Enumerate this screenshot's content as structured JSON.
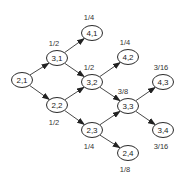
{
  "diagram": {
    "type": "directed-graph",
    "colors": {
      "stroke": "#2a2a2a",
      "text": "#222222",
      "background": "#ffffff"
    },
    "nodes": [
      {
        "id": "2,1",
        "label": "2,1",
        "x": 22,
        "y": 80,
        "prob": null,
        "prob_x": null,
        "prob_y": null
      },
      {
        "id": "3,1",
        "label": "3,1",
        "x": 57,
        "y": 58,
        "prob": "1/2",
        "prob_x": 54,
        "prob_y": 43
      },
      {
        "id": "4,1",
        "label": "4,1",
        "x": 92,
        "y": 33,
        "prob": "1/4",
        "prob_x": 89,
        "prob_y": 17
      },
      {
        "id": "3,2",
        "label": "3,2",
        "x": 92,
        "y": 82,
        "prob": "1/2",
        "prob_x": 89,
        "prob_y": 67
      },
      {
        "id": "4,2",
        "label": "4,2",
        "x": 128,
        "y": 57,
        "prob": "1/4",
        "prob_x": 125,
        "prob_y": 42
      },
      {
        "id": "2,2",
        "label": "2,2",
        "x": 57,
        "y": 105,
        "prob": "1/2",
        "prob_x": 54,
        "prob_y": 122
      },
      {
        "id": "3,3",
        "label": "3,3",
        "x": 128,
        "y": 106,
        "prob": "3/8",
        "prob_x": 123,
        "prob_y": 91
      },
      {
        "id": "4,3",
        "label": "4,3",
        "x": 163,
        "y": 82,
        "prob": "3/16",
        "prob_x": 161,
        "prob_y": 67
      },
      {
        "id": "2,3",
        "label": "2,3",
        "x": 92,
        "y": 130,
        "prob": "1/4",
        "prob_x": 89,
        "prob_y": 146
      },
      {
        "id": "3,4",
        "label": "3,4",
        "x": 163,
        "y": 130,
        "prob": "3/16",
        "prob_x": 161,
        "prob_y": 146
      },
      {
        "id": "2,4",
        "label": "2,4",
        "x": 128,
        "y": 153,
        "prob": "1/8",
        "prob_x": 125,
        "prob_y": 169
      }
    ],
    "edges": [
      {
        "from": "2,1",
        "to": "3,1"
      },
      {
        "from": "2,1",
        "to": "2,2"
      },
      {
        "from": "3,1",
        "to": "4,1"
      },
      {
        "from": "3,1",
        "to": "3,2"
      },
      {
        "from": "2,2",
        "to": "3,2"
      },
      {
        "from": "2,2",
        "to": "2,3"
      },
      {
        "from": "3,2",
        "to": "4,2"
      },
      {
        "from": "3,2",
        "to": "3,3"
      },
      {
        "from": "2,3",
        "to": "3,3"
      },
      {
        "from": "2,3",
        "to": "2,4"
      },
      {
        "from": "3,3",
        "to": "4,3"
      },
      {
        "from": "3,3",
        "to": "3,4"
      }
    ]
  }
}
